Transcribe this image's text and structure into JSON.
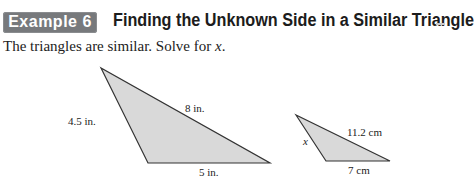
{
  "header": {
    "badge_label": "Example 6",
    "title": "Finding the Unknown Side in a Similar Triangle"
  },
  "prompt": {
    "text": "The triangles are similar. Solve for ",
    "variable": "x",
    "end": "."
  },
  "figures": {
    "large_triangle": {
      "left_side": "4.5 in.",
      "top_side": "8 in.",
      "bottom_side": "5 in."
    },
    "small_triangle": {
      "left_side": "x",
      "top_side": "11.2 cm",
      "bottom_side": "7 cm"
    }
  },
  "colors": {
    "badge": "#77797c",
    "triangle_fill": "#d9d9d9",
    "stroke": "#333333"
  }
}
